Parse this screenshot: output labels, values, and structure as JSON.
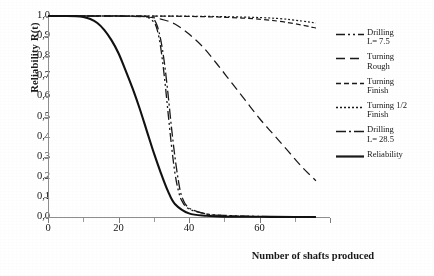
{
  "chart_data": {
    "type": "line",
    "title": "",
    "xlabel": "Number of shafts produced",
    "ylabel": "Reliability  R(t)",
    "xlim": [
      0,
      80
    ],
    "ylim": [
      0,
      1
    ],
    "grid": false,
    "legend_position": "right",
    "x_ticks": [
      "0",
      "20",
      "40",
      "60"
    ],
    "x_ticks_values": [
      0,
      20,
      40,
      60
    ],
    "y_ticks": [
      "0,0",
      "0,1",
      "0,2",
      "0,3",
      "0,4",
      "0,5",
      "0,6",
      "0,7",
      "0,8",
      "0,9",
      "1,0"
    ],
    "y_ticks_values": [
      0,
      0.1,
      0.2,
      0.3,
      0.4,
      0.5,
      0.6,
      0.7,
      0.8,
      0.9,
      1.0
    ],
    "series": [
      {
        "name": "Drilling L= 7.5",
        "style": "dash-dot-dot",
        "color": "#1a1a1a",
        "x": [
          0,
          10,
          20,
          25,
          28,
          30,
          31,
          32,
          33,
          34,
          35,
          36,
          37,
          38,
          40,
          45,
          50,
          60,
          70,
          76
        ],
        "values": [
          1.0,
          1.0,
          1.0,
          0.999,
          0.995,
          0.97,
          0.93,
          0.84,
          0.7,
          0.53,
          0.36,
          0.22,
          0.13,
          0.08,
          0.04,
          0.015,
          0.008,
          0.003,
          0.001,
          0.0
        ]
      },
      {
        "name": "Turning Rough",
        "style": "long-dash",
        "color": "#1a1a1a",
        "x": [
          0,
          10,
          20,
          28,
          32,
          36,
          40,
          44,
          48,
          52,
          56,
          60,
          64,
          68,
          72,
          76
        ],
        "values": [
          1.0,
          1.0,
          0.999,
          0.995,
          0.985,
          0.96,
          0.91,
          0.845,
          0.76,
          0.67,
          0.58,
          0.49,
          0.41,
          0.33,
          0.25,
          0.18
        ]
      },
      {
        "name": "Turning Finish",
        "style": "dash",
        "color": "#1a1a1a",
        "x": [
          0,
          20,
          40,
          55,
          65,
          72,
          76
        ],
        "values": [
          1.0,
          1.0,
          0.998,
          0.99,
          0.975,
          0.955,
          0.94
        ]
      },
      {
        "name": "Turning 1/2 Finish",
        "style": "dotted",
        "color": "#1a1a1a",
        "x": [
          0,
          20,
          40,
          55,
          65,
          72,
          76
        ],
        "values": [
          1.0,
          1.0,
          0.999,
          0.995,
          0.988,
          0.975,
          0.965
        ]
      },
      {
        "name": "Drilling L= 28.5",
        "style": "dash-dot",
        "color": "#1a1a1a",
        "x": [
          0,
          10,
          20,
          26,
          29,
          30,
          31,
          32,
          33,
          34,
          35,
          36,
          37,
          38,
          40,
          45,
          50,
          60,
          70,
          76
        ],
        "values": [
          1.0,
          1.0,
          1.0,
          0.999,
          0.995,
          0.985,
          0.95,
          0.88,
          0.77,
          0.62,
          0.45,
          0.3,
          0.18,
          0.1,
          0.045,
          0.015,
          0.007,
          0.002,
          0.001,
          0.0
        ]
      },
      {
        "name": "Reliability",
        "style": "solid",
        "color": "#111111",
        "x": [
          0,
          5,
          8,
          10,
          12,
          14,
          16,
          18,
          20,
          22,
          24,
          26,
          28,
          30,
          32,
          34,
          36,
          40,
          45,
          50,
          60,
          70,
          76
        ],
        "values": [
          1.0,
          1.0,
          0.999,
          0.995,
          0.985,
          0.965,
          0.93,
          0.88,
          0.815,
          0.73,
          0.64,
          0.54,
          0.43,
          0.32,
          0.22,
          0.13,
          0.065,
          0.018,
          0.006,
          0.002,
          0.001,
          0.0,
          0.0
        ]
      }
    ]
  },
  "axes": {
    "y_title": "Reliability  R(t)",
    "x_title": "Number of shafts produced"
  },
  "legend": {
    "entries": [
      {
        "label": "Drilling\nL= 7.5",
        "style": "dash-dot-dot"
      },
      {
        "label": "Turning\nRough",
        "style": "long-dash"
      },
      {
        "label": "Turning\nFinish",
        "style": "dash"
      },
      {
        "label": "Turning 1/2\nFinish",
        "style": "dotted"
      },
      {
        "label": "Drilling\nL= 28.5",
        "style": "dash-dot"
      },
      {
        "label": "Reliability",
        "style": "solid"
      }
    ]
  }
}
